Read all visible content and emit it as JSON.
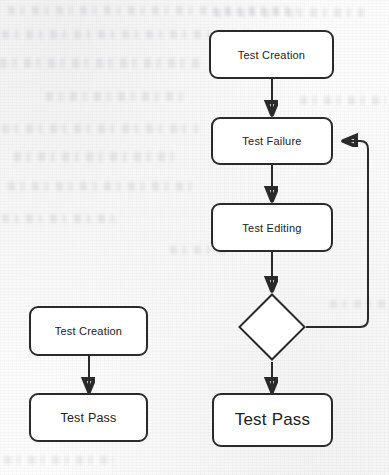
{
  "diagram": {
    "type": "flowchart",
    "title": "",
    "background": "scanned-paper",
    "stroke_color": "#2a2a2a",
    "fill_color": "#ffffff",
    "flows": [
      {
        "id": "left-flow",
        "name": "simple-pass-flow",
        "nodes": [
          {
            "id": "left-test-creation",
            "label": "Test Creation",
            "shape": "rounded-rect"
          },
          {
            "id": "left-test-pass",
            "label": "Test Pass",
            "shape": "rounded-rect"
          }
        ],
        "edges": [
          {
            "from": "left-test-creation",
            "to": "left-test-pass",
            "label": ""
          }
        ]
      },
      {
        "id": "right-flow",
        "name": "failure-edit-retry-flow",
        "nodes": [
          {
            "id": "right-test-creation",
            "label": "Test Creation",
            "shape": "rounded-rect"
          },
          {
            "id": "right-test-failure",
            "label": "Test Failure",
            "shape": "rounded-rect"
          },
          {
            "id": "right-test-editing",
            "label": "Test Editing",
            "shape": "rounded-rect"
          },
          {
            "id": "right-decision",
            "label": "",
            "shape": "diamond"
          },
          {
            "id": "right-test-pass",
            "label": "Test Pass",
            "shape": "rounded-rect"
          }
        ],
        "edges": [
          {
            "from": "right-test-creation",
            "to": "right-test-failure",
            "label": ""
          },
          {
            "from": "right-test-failure",
            "to": "right-test-editing",
            "label": ""
          },
          {
            "from": "right-test-editing",
            "to": "right-decision",
            "label": ""
          },
          {
            "from": "right-decision",
            "to": "right-test-pass",
            "label": ""
          },
          {
            "from": "right-decision",
            "to": "right-test-failure",
            "label": "",
            "kind": "feedback-loop"
          }
        ]
      }
    ]
  }
}
